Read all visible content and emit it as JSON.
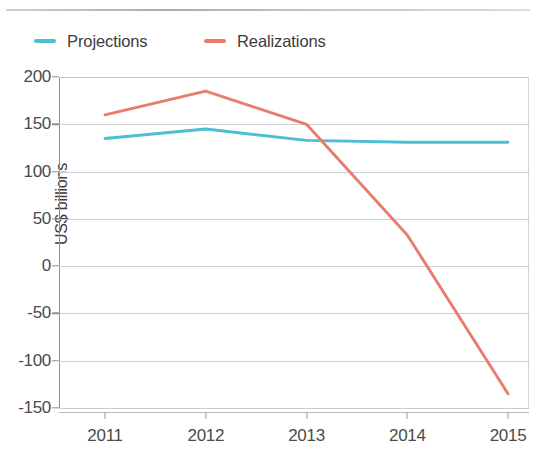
{
  "legend": {
    "position": "top-left",
    "entries": [
      {
        "label": "Projections",
        "color": "#4cbfd2"
      },
      {
        "label": "Realizations",
        "color": "#e87c6d"
      }
    ]
  },
  "axes": {
    "y_title": "US$ billions",
    "y_ticks": [
      "200",
      "150",
      "100",
      "50",
      "0",
      "-50",
      "-100",
      "-150"
    ],
    "x_ticks": [
      "2011",
      "2012",
      "2013",
      "2014",
      "2015"
    ]
  },
  "chart_data": {
    "type": "line",
    "title": "",
    "subtitle": "",
    "xlabel": "",
    "ylabel": "US$ billions",
    "x": [
      2011,
      2012,
      2013,
      2014,
      2015
    ],
    "categories": [
      "2011",
      "2012",
      "2013",
      "2014",
      "2015"
    ],
    "series": [
      {
        "name": "Projections",
        "color": "#4cbfd2",
        "values": [
          135,
          145,
          133,
          131,
          131
        ]
      },
      {
        "name": "Realizations",
        "color": "#e87c6d",
        "values": [
          160,
          185,
          150,
          33,
          -135
        ]
      }
    ],
    "ylim": [
      -150,
      200
    ],
    "ytick_values": [
      200,
      150,
      100,
      50,
      0,
      -50,
      -100,
      -150
    ],
    "xlim": [
      2011,
      2015
    ],
    "grid": "horizontal",
    "legend_position": "top-left",
    "annotations": []
  }
}
